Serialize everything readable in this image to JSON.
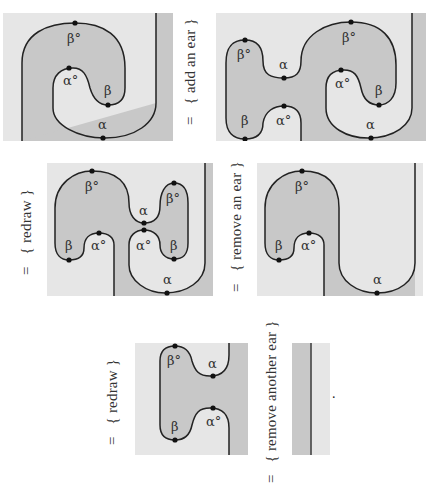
{
  "colors": {
    "shade_dark": "#c8c8c8",
    "shade_light": "#e6e6e6",
    "curve": "#222222",
    "dot": "#111111"
  },
  "steps": [
    {
      "eq": "=",
      "annotation": "{ add an ear }"
    },
    {
      "eq": "=",
      "annotation": "{ redraw }"
    },
    {
      "eq": "=",
      "annotation": "{ remove an ear }"
    },
    {
      "eq": "=",
      "annotation": "{ redraw }"
    },
    {
      "eq": "=",
      "annotation": "{ remove another ear }"
    }
  ],
  "labels": {
    "alpha": "α",
    "alpha_circ": "α°",
    "beta": "β",
    "beta_circ": "β°"
  },
  "final_period": "."
}
